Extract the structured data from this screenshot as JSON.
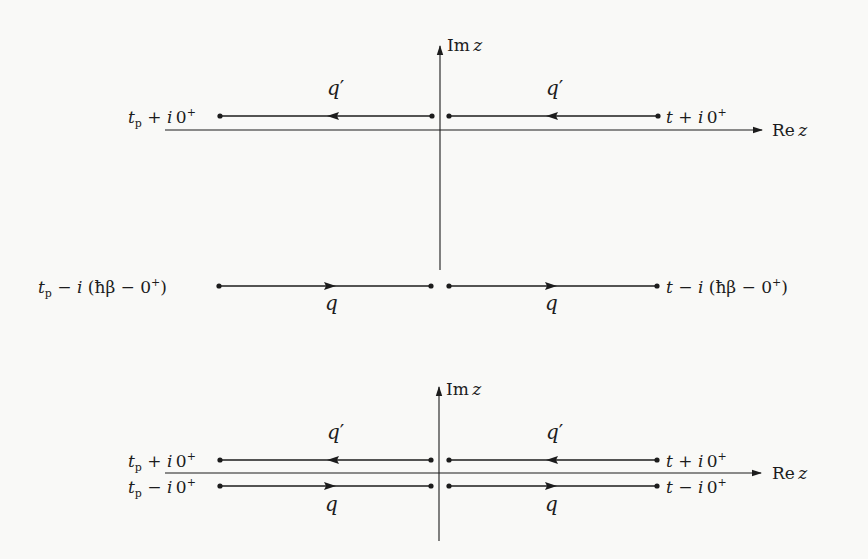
{
  "figure": {
    "type": "contour-diagram",
    "colors": {
      "ink": "#1c1c1c",
      "background": "#f9f9f7"
    }
  },
  "top_panel": {
    "axes": {
      "im_label": {
        "main": "Im",
        "var": "z"
      },
      "re_label": {
        "main": "Re",
        "var": "z"
      },
      "origin": {
        "x": 440,
        "y": 130
      },
      "im_axis": {
        "y_top": 45,
        "y_bottom": 270
      },
      "re_axis": {
        "x_left": 165,
        "x_right": 762
      }
    },
    "upper_branch": {
      "y": 116,
      "direction": "left",
      "segments": [
        {
          "x1": 220,
          "x2": 432,
          "arrow_x": 333
        },
        {
          "x1": 449,
          "x2": 658,
          "arrow_x": 552
        }
      ],
      "field_labels": [
        {
          "text": "q",
          "prime": "′",
          "x": 327,
          "y": 78
        },
        {
          "text": "q",
          "prime": "′",
          "x": 546,
          "y": 78
        }
      ],
      "left_endpoint": {
        "t": "t",
        "sub": "p",
        "op": " + ",
        "i": "i",
        "rest": "0",
        "sup": "+"
      },
      "right_endpoint": {
        "t": "t",
        "op": " + ",
        "i": "i",
        "rest": "0",
        "sup": "+"
      }
    },
    "lower_branch": {
      "y": 286,
      "direction": "right",
      "segments": [
        {
          "x1": 219,
          "x2": 431,
          "arrow_x": 330
        },
        {
          "x1": 449,
          "x2": 657,
          "arrow_x": 551
        }
      ],
      "field_labels": [
        {
          "text": "q",
          "x": 325,
          "y": 293
        },
        {
          "text": "q",
          "x": 545,
          "y": 293
        }
      ],
      "left_endpoint": {
        "t": "t",
        "sub": "p",
        "op": " − ",
        "i": "i",
        "rest": " (ħβ − 0",
        "sup": "+",
        "close": ")"
      },
      "right_endpoint": {
        "t": "t",
        "op": " − ",
        "i": "i",
        "rest": " (ħβ − 0",
        "sup": "+",
        "close": ")"
      }
    }
  },
  "bottom_panel": {
    "axes": {
      "im_label": {
        "main": "Im",
        "var": "z"
      },
      "re_label": {
        "main": "Re",
        "var": "z"
      },
      "origin": {
        "x": 439,
        "y": 473
      },
      "im_axis": {
        "y_top": 386,
        "y_bottom": 541
      },
      "re_axis": {
        "x_left": 165,
        "x_right": 761
      }
    },
    "upper_branch": {
      "y": 460,
      "direction": "left",
      "segments": [
        {
          "x1": 220,
          "x2": 431,
          "arrow_x": 333
        },
        {
          "x1": 449,
          "x2": 657,
          "arrow_x": 552
        }
      ],
      "field_labels": [
        {
          "text": "q",
          "prime": "′",
          "x": 327,
          "y": 422
        },
        {
          "text": "q",
          "prime": "′",
          "x": 546,
          "y": 422
        }
      ],
      "left_endpoint": {
        "t": "t",
        "sub": "p",
        "op": " + ",
        "i": "i",
        "rest": "0",
        "sup": "+"
      },
      "right_endpoint": {
        "t": "t",
        "op": " + ",
        "i": "i",
        "rest": "0",
        "sup": "+"
      }
    },
    "lower_branch": {
      "y": 486,
      "direction": "right",
      "segments": [
        {
          "x1": 220,
          "x2": 431,
          "arrow_x": 330
        },
        {
          "x1": 449,
          "x2": 657,
          "arrow_x": 551
        }
      ],
      "field_labels": [
        {
          "text": "q",
          "x": 325,
          "y": 494
        },
        {
          "text": "q",
          "x": 545,
          "y": 494
        }
      ],
      "left_endpoint": {
        "t": "t",
        "sub": "p",
        "op": " − ",
        "i": "i",
        "rest": "0",
        "sup": "+"
      },
      "right_endpoint": {
        "t": "t",
        "op": " − ",
        "i": "i",
        "rest": "0",
        "sup": "+"
      }
    }
  }
}
